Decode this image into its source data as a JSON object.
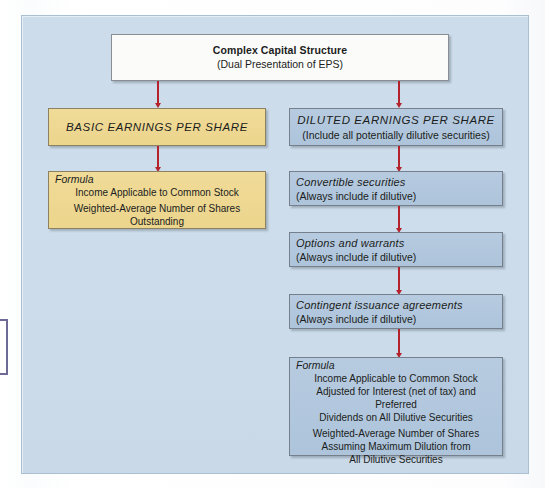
{
  "diagram": {
    "type": "flowchart",
    "accent_arrow_color": "#b4232c",
    "panel_color": "#ccdcea",
    "basic_node_color": "#efd995",
    "diluted_node_color": "#b3c8de",
    "top": {
      "title": "Complex Capital Structure",
      "subtitle": "(Dual Presentation of EPS)"
    },
    "left_branch": {
      "header": "BASIC EARNINGS PER SHARE",
      "formula": {
        "label": "Formula",
        "numerator": [
          "Income Applicable to Common Stock"
        ],
        "denominator": [
          "Weighted-Average Number of Shares Outstanding"
        ]
      }
    },
    "right_branch": {
      "header": "DILUTED EARNINGS PER SHARE",
      "header_note": "(Include all potentially dilutive securities)",
      "items": [
        {
          "title": "Convertible securities",
          "note": "(Always include if dilutive)"
        },
        {
          "title": "Options and warrants",
          "note": "(Always include if dilutive)"
        },
        {
          "title": "Contingent issuance agreements",
          "note": "(Always include if dilutive)"
        }
      ],
      "formula": {
        "label": "Formula",
        "numerator": [
          "Income Applicable to Common Stock",
          "Adjusted for Interest (net of tax) and Preferred",
          "Dividends on All Dilutive Securities"
        ],
        "denominator": [
          "Weighted-Average Number of Shares",
          "Assuming Maximum Dilution from",
          "All Dilutive Securities"
        ]
      }
    }
  }
}
